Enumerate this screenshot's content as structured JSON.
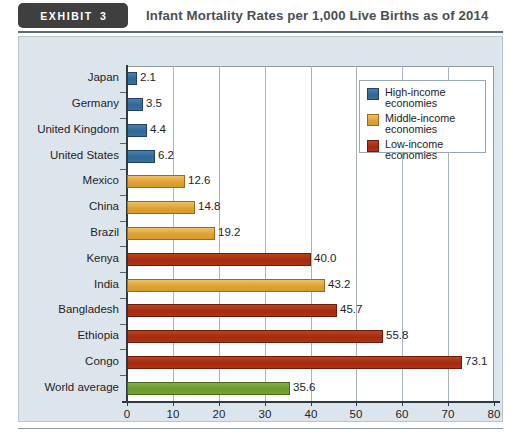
{
  "header": {
    "exhibit_label": "EXHIBIT",
    "exhibit_number": "3",
    "title": "Infant Mortality Rates per 1,000 Live Births as of 2014"
  },
  "colors": {
    "panel_background": "#dde5ec",
    "plot_background": "#ffffff",
    "high_income": "#2f6796",
    "middle_income": "#e0a033",
    "low_income": "#a52a10",
    "world_average": "#6a9a2e",
    "axis": "#2f3942",
    "gridline": "#aab4bf",
    "tab_background": "#3f3f3f",
    "title_text": "#4a4f55"
  },
  "legend": {
    "items": [
      {
        "label": "High-income\neconomies",
        "line1": "High-income",
        "line2": "economies",
        "key": "high"
      },
      {
        "label": "Middle-income\neconomies",
        "line1": "Middle-income",
        "line2": "economies",
        "key": "middle"
      },
      {
        "label": "Low-income\neconomies",
        "line1": "Low-income",
        "line2": "economies",
        "key": "low"
      }
    ]
  },
  "chart_data": {
    "type": "bar",
    "orientation": "horizontal",
    "title": "Infant Mortality Rates per 1,000 Live Births as of 2014",
    "xlabel": "",
    "ylabel": "",
    "xlim": [
      0,
      80
    ],
    "xticks": [
      0,
      10,
      20,
      30,
      40,
      50,
      60,
      70,
      80
    ],
    "grid": "vertical",
    "legend_position": "top-right",
    "categories": [
      "Japan",
      "Germany",
      "United Kingdom",
      "United States",
      "Mexico",
      "China",
      "Brazil",
      "Kenya",
      "India",
      "Bangladesh",
      "Ethiopia",
      "Congo",
      "World average"
    ],
    "values": [
      2.1,
      3.5,
      4.4,
      6.2,
      12.6,
      14.8,
      19.2,
      40.0,
      43.2,
      45.7,
      55.8,
      73.1,
      35.6
    ],
    "value_labels": [
      "2.1",
      "3.5",
      "4.4",
      "6.2",
      "12.6",
      "14.8",
      "19.2",
      "40.0",
      "43.2",
      "45.7",
      "55.8",
      "73.1",
      "35.6"
    ],
    "groups": [
      "high",
      "high",
      "high",
      "high",
      "middle",
      "middle",
      "middle",
      "low",
      "middle",
      "low",
      "low",
      "low",
      "world"
    ],
    "series": [
      {
        "name": "High-income economies",
        "key": "high",
        "color": "#2f6796",
        "points": [
          {
            "category": "Japan",
            "value": 2.1
          },
          {
            "category": "Germany",
            "value": 3.5
          },
          {
            "category": "United Kingdom",
            "value": 4.4
          },
          {
            "category": "United States",
            "value": 6.2
          }
        ]
      },
      {
        "name": "Middle-income economies",
        "key": "middle",
        "color": "#e0a033",
        "points": [
          {
            "category": "Mexico",
            "value": 12.6
          },
          {
            "category": "China",
            "value": 14.8
          },
          {
            "category": "Brazil",
            "value": 19.2
          },
          {
            "category": "India",
            "value": 43.2
          }
        ]
      },
      {
        "name": "Low-income economies",
        "key": "low",
        "color": "#a52a10",
        "points": [
          {
            "category": "Kenya",
            "value": 40.0
          },
          {
            "category": "Bangladesh",
            "value": 45.7
          },
          {
            "category": "Ethiopia",
            "value": 55.8
          },
          {
            "category": "Congo",
            "value": 73.1
          }
        ]
      },
      {
        "name": "World average",
        "key": "world",
        "color": "#6a9a2e",
        "points": [
          {
            "category": "World average",
            "value": 35.6
          }
        ]
      }
    ]
  }
}
